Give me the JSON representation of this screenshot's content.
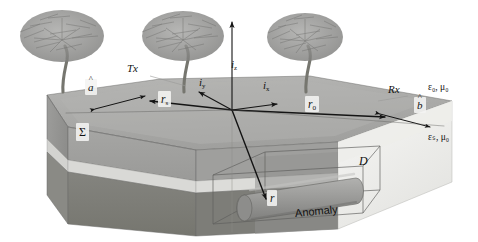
{
  "figure": {
    "type": "3d-block-diagram",
    "background_color": "#ffffff",
    "line_color": "#1a1a1a",
    "palette": {
      "air": "#ffffff",
      "surface_top": "#a9a9a9",
      "surface_top_light": "#b9b9b7",
      "left_face_upper": "#9a9a98",
      "left_face_lower": "#8a8a88",
      "front_face_upper": "#a0a09e",
      "front_face_lower": "#7d7d7b",
      "stratum_light": "#d7d7d4",
      "cut_plane": "#efefed",
      "anomaly_body": "#9b9b99",
      "anomaly_shadow": "#858583",
      "tree_gray": "#8e8e8c",
      "trunk_gray": "#7a7a78",
      "label_chip": "#f4f4f2"
    }
  },
  "media": {
    "upper_halfspace": {
      "label": "ε₀, μ₀",
      "epsilon": "ε₀",
      "mu": "μ₀",
      "description": "air"
    },
    "lower_halfspace": {
      "label": "εₛ, μ₀",
      "epsilon": "εₛ",
      "mu": "μ₀",
      "description": "soil"
    }
  },
  "antennas": {
    "transmitter": {
      "name": "Tx",
      "label": "Tx",
      "orientation_vector": "â",
      "orientation_label": "a",
      "position_vector": "rₛ",
      "position_label": "r",
      "position_sub": "s"
    },
    "receiver": {
      "name": "Rx",
      "label": "Rx",
      "orientation_vector": "b̂",
      "orientation_label": "b",
      "position_vector": "r₀",
      "position_label": "r",
      "position_sub": "0"
    }
  },
  "axes": {
    "x": {
      "label": "i",
      "sub": "x",
      "full": "iₓ",
      "direction": "right-forward"
    },
    "y": {
      "label": "i",
      "sub": "y",
      "full": "iᵧ",
      "direction": "left-back"
    },
    "z": {
      "label": "i",
      "sub": "z",
      "full": "iᵩ",
      "direction": "up"
    }
  },
  "vectors": {
    "r_field": {
      "label": "r",
      "description": "field / observation point inside the anomaly"
    },
    "r_source": {
      "label": "r",
      "sub": "s",
      "description": "transmitter position vector"
    },
    "r_receiver": {
      "label": "r",
      "sub": "0",
      "description": "receiver position vector"
    },
    "a_hat": {
      "label": "a",
      "hat": "ˆ",
      "description": "transmitter unit orientation vector"
    },
    "b_hat": {
      "label": "b",
      "hat": "ˆ",
      "description": "receiver unit orientation vector"
    }
  },
  "regions": {
    "surface": {
      "label": "Σ",
      "name": "Sigma",
      "description": "air-soil interface surface"
    },
    "domain": {
      "label": "D",
      "name": "D",
      "description": "scattering domain enclosing the anomaly"
    },
    "anomaly": {
      "label": "Anomaly",
      "name": "Anomaly",
      "shape": "buried horizontal cylinder"
    }
  },
  "scenery": {
    "trees": [
      {
        "id": "tree-left",
        "x": 62,
        "y": 92
      },
      {
        "id": "tree-center",
        "x": 183,
        "y": 92
      },
      {
        "id": "tree-right",
        "x": 305,
        "y": 92
      }
    ]
  },
  "labels": [
    {
      "id": "a-hat",
      "text": "a",
      "kind": "hat",
      "x": 88,
      "y": 86
    },
    {
      "id": "tx",
      "text": "Tx",
      "kind": "ital",
      "x": 131,
      "y": 68
    },
    {
      "id": "r-s",
      "text": "r",
      "sub": "s",
      "x": 163,
      "y": 99
    },
    {
      "id": "i-y",
      "text": "i",
      "sub": "y",
      "x": 204,
      "y": 82
    },
    {
      "id": "i-z",
      "text": "i",
      "sub": "z",
      "x": 234,
      "y": 64
    },
    {
      "id": "i-x",
      "text": "i",
      "sub": "x",
      "x": 268,
      "y": 85
    },
    {
      "id": "r-0",
      "text": "r",
      "sub": "0",
      "x": 310,
      "y": 104
    },
    {
      "id": "rx",
      "text": "Rx",
      "kind": "ital",
      "x": 392,
      "y": 88
    },
    {
      "id": "b-hat",
      "text": "b",
      "kind": "hat",
      "x": 417,
      "y": 105
    },
    {
      "id": "eps-0-mu-0",
      "text": "ε₀, μ₀",
      "kind": "plain",
      "x": 432,
      "y": 87
    },
    {
      "id": "eps-s-mu-0",
      "text": "εₛ, μ₀",
      "kind": "plain",
      "x": 432,
      "y": 137
    },
    {
      "id": "sigma",
      "text": "Σ",
      "kind": "plain",
      "x": 80,
      "y": 131
    },
    {
      "id": "d-domain",
      "text": "D",
      "kind": "ital",
      "x": 362,
      "y": 160
    },
    {
      "id": "r-field",
      "text": "r",
      "kind": "ital",
      "x": 272,
      "y": 198
    },
    {
      "id": "anomaly",
      "text": "Anomaly",
      "kind": "plain",
      "x": 313,
      "y": 213
    }
  ],
  "arrows": [
    {
      "id": "arrow-a-hat",
      "from": "r_s-area",
      "to": "a-hat",
      "description": "double-headed transmitter orientation arrow"
    },
    {
      "id": "arrow-r-s",
      "from": "origin",
      "to": "r_s",
      "description": "origin to transmitter"
    },
    {
      "id": "arrow-r-0",
      "from": "origin",
      "to": "r_0",
      "description": "origin to receiver"
    },
    {
      "id": "arrow-b-hat",
      "from": "r_0-area",
      "to": "b-hat",
      "description": "double-headed receiver orientation arrow"
    },
    {
      "id": "arrow-r",
      "from": "origin",
      "to": "r",
      "description": "origin down to anomaly point"
    },
    {
      "id": "arrow-i-x",
      "from": "origin",
      "to": "i_x",
      "description": "x unit axis"
    },
    {
      "id": "arrow-i-y",
      "from": "origin",
      "to": "i_y",
      "description": "y unit axis"
    },
    {
      "id": "arrow-i-z",
      "from": "origin",
      "to": "i_z",
      "description": "z unit axis"
    }
  ]
}
